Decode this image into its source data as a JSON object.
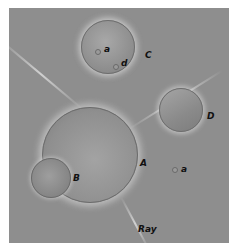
{
  "figure": {
    "labels": {
      "cell_a": "A",
      "cell_b": "B",
      "cell_c": "C",
      "cell_d": "D",
      "inclusion_a_in_c": "a",
      "inclusion_d_in_c": "d",
      "inclusion_a_outside": "a",
      "ray": "Ray"
    },
    "colors": {
      "background": "#8e8e8e",
      "halo": "#d8d8d8",
      "label": "#111111"
    }
  }
}
